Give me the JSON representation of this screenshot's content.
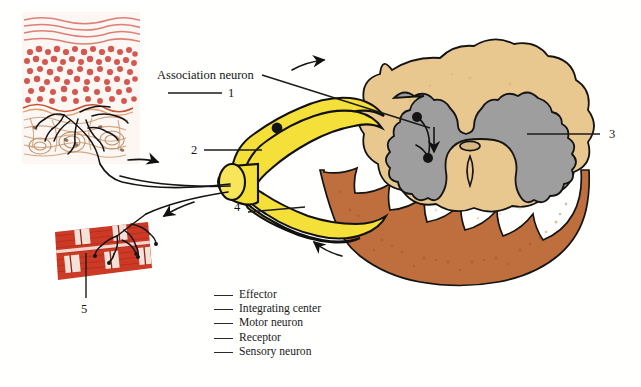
{
  "figure": {
    "title_callout": "Association neuron",
    "numbered_labels": [
      {
        "id": "1",
        "text": "1"
      },
      {
        "id": "2",
        "text": "2"
      },
      {
        "id": "3",
        "text": "3"
      },
      {
        "id": "4",
        "text": "4"
      },
      {
        "id": "5",
        "text": "5"
      }
    ],
    "legend": {
      "items": [
        {
          "blank": "",
          "term": "Effector"
        },
        {
          "blank": "",
          "term": "Integrating center"
        },
        {
          "blank": "",
          "term": "Motor neuron"
        },
        {
          "blank": "",
          "term": "Receptor"
        },
        {
          "blank": "",
          "term": "Sensory neuron"
        }
      ]
    },
    "structures": {
      "skin": "skin-cross-section",
      "muscle": "skeletal-muscle-fibers",
      "spinal_cord": "spinal-cord-cross-section",
      "gray_matter": "butterfly-gray-matter",
      "central_canal": "central-canal",
      "dorsal_root_ganglion": "dorsal-root-ganglion",
      "nerve": "spinal-nerve"
    },
    "colors": {
      "nerve_yellow": "#f5e03a",
      "cord_tan": "#e8c88e",
      "cut_surface_brown": "#c0713f",
      "gray_matter": "#9b9b9b",
      "skin_red": "#cf4a47",
      "muscle_red": "#cc3322",
      "outline": "#111111"
    },
    "flow_arrows": [
      {
        "name": "sensory-inbound-arrow",
        "direction": "right"
      },
      {
        "name": "sensory-ascending-arrow",
        "direction": "up-right"
      },
      {
        "name": "motor-descending-arrow",
        "direction": "down-left"
      },
      {
        "name": "motor-to-effector-arrow",
        "direction": "left"
      },
      {
        "name": "gray-matter-relay-arrow",
        "direction": "down"
      }
    ]
  }
}
